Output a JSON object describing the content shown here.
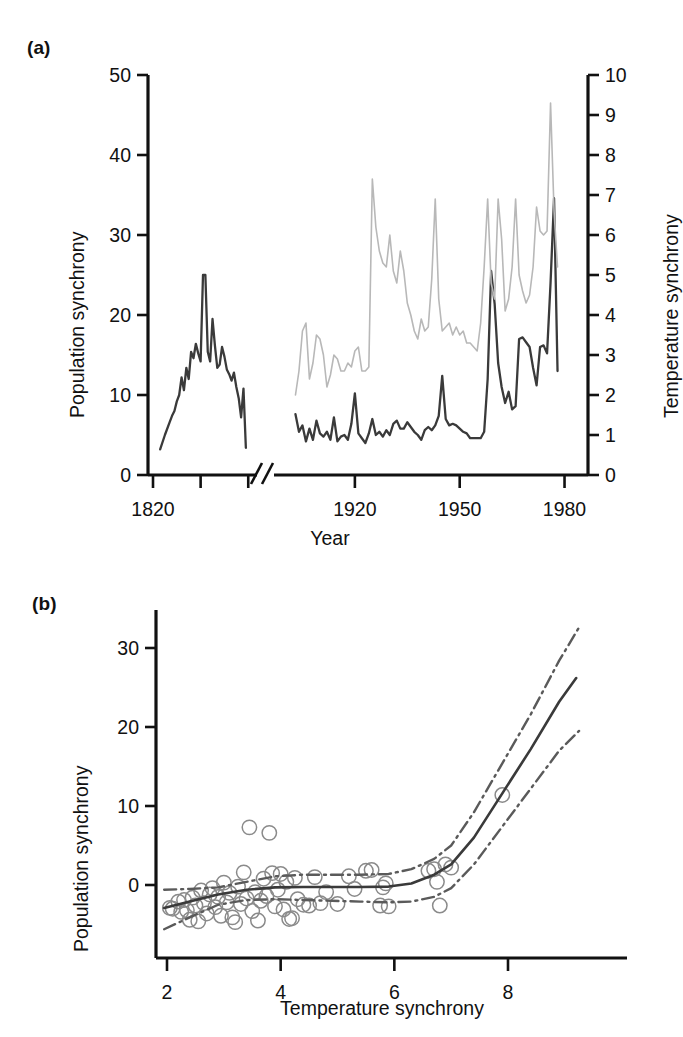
{
  "figure": {
    "background": "#ffffff",
    "ink": "#1a1a1a"
  },
  "panel_a": {
    "label": "(a)",
    "left_axis_title": "Population synchrony",
    "right_axis_title": "Temperature synchrony",
    "x_axis_title": "Year",
    "axis_break_note": "broken x-axis between 1860 and 1900",
    "colors": {
      "population_line": "#3a3a3a",
      "temperature_line": "#b8b8b8",
      "axis": "#111111"
    }
  },
  "panel_b": {
    "label": "(b)",
    "y_axis_title": "Population synchrony",
    "x_axis_title": "Temperature synchrony",
    "colors": {
      "fit_line": "#3a3a3a",
      "confidence_line": "#5a5a5a",
      "point_stroke": "#8a8a8a",
      "axis": "#111111"
    }
  },
  "chart_data": [
    {
      "id": "panel-a",
      "type": "line",
      "title": "(a)",
      "xlabel": "Year",
      "ylabel": "Population synchrony",
      "y2label": "Temperature synchrony",
      "xlim": [
        1820,
        1985
      ],
      "ylim": [
        0,
        50
      ],
      "y2lim": [
        0,
        10
      ],
      "grid": false,
      "legend": "none",
      "x_break": {
        "from": 1862,
        "to": 1898,
        "label": "axis break"
      },
      "xticks": [
        1820,
        1840,
        1860,
        1920,
        1950,
        1980
      ],
      "xticklabels": [
        "1820",
        "",
        "",
        "1920",
        "1950",
        "1980"
      ],
      "yticks": [
        0,
        10,
        20,
        30,
        40,
        50
      ],
      "yticklabels": [
        "0",
        "10",
        "20",
        "30",
        "40",
        "50"
      ],
      "y2ticks": [
        0,
        1,
        2,
        3,
        4,
        5,
        6,
        7,
        8,
        9,
        10
      ],
      "y2ticklabels": [
        "0",
        "1",
        "2",
        "3",
        "4",
        "5",
        "6",
        "7",
        "8",
        "9",
        "10"
      ],
      "series": [
        {
          "name": "Population synchrony",
          "axis": "left",
          "color": "#3a3a3a",
          "segment": "early",
          "x": [
            1823,
            1825,
            1827,
            1828,
            1829,
            1830,
            1831,
            1832,
            1833,
            1834,
            1835,
            1836,
            1837,
            1838,
            1839,
            1840,
            1841,
            1842,
            1843,
            1844,
            1845,
            1846,
            1847,
            1848,
            1849,
            1850,
            1851,
            1852,
            1853,
            1854,
            1855,
            1856,
            1857,
            1858,
            1859
          ],
          "y": [
            3.2,
            5.0,
            6.6,
            7.4,
            8.0,
            9.2,
            10.0,
            12.2,
            10.6,
            13.4,
            12.0,
            15.4,
            14.6,
            16.4,
            15.2,
            14.2,
            25.0,
            25.0,
            15.4,
            14.2,
            19.5,
            16.2,
            13.4,
            13.8,
            16.0,
            14.8,
            13.2,
            12.6,
            11.8,
            12.8,
            11.0,
            9.6,
            7.2,
            10.8,
            3.4
          ]
        },
        {
          "name": "Population synchrony",
          "axis": "left",
          "color": "#3a3a3a",
          "segment": "late",
          "x": [
            1903,
            1904,
            1905,
            1906,
            1907,
            1908,
            1909,
            1910,
            1911,
            1912,
            1913,
            1914,
            1915,
            1916,
            1917,
            1918,
            1919,
            1920,
            1921,
            1922,
            1923,
            1924,
            1925,
            1926,
            1927,
            1928,
            1929,
            1930,
            1931,
            1932,
            1933,
            1934,
            1935,
            1936,
            1937,
            1938,
            1939,
            1940,
            1941,
            1942,
            1943,
            1944,
            1945,
            1946,
            1947,
            1948,
            1949,
            1950,
            1951,
            1952,
            1953,
            1954,
            1955,
            1956,
            1957,
            1958,
            1959,
            1960,
            1961,
            1962,
            1963,
            1964,
            1965,
            1966,
            1967,
            1968,
            1969,
            1970,
            1971,
            1972,
            1973,
            1974,
            1975,
            1976,
            1977,
            1978,
            1979,
            1980
          ],
          "y": [
            7.6,
            5.4,
            6.2,
            4.2,
            5.8,
            4.4,
            6.8,
            5.2,
            4.8,
            5.4,
            4.4,
            7.2,
            4.2,
            4.8,
            5.0,
            4.4,
            6.4,
            10.2,
            5.2,
            4.6,
            4.0,
            5.2,
            7.0,
            5.0,
            5.4,
            4.8,
            5.6,
            5.0,
            6.4,
            6.8,
            5.8,
            5.8,
            6.6,
            6.0,
            5.4,
            5.0,
            4.4,
            5.6,
            6.0,
            5.6,
            6.2,
            7.4,
            12.4,
            7.0,
            6.2,
            6.4,
            6.2,
            5.8,
            5.4,
            5.2,
            4.6,
            4.6,
            4.6,
            4.6,
            5.4,
            12.0,
            25.5,
            21.4,
            14.0,
            11.0,
            9.0,
            10.4,
            8.2,
            8.6,
            17.0,
            17.2,
            16.6,
            16.0,
            13.4,
            11.2,
            16.0,
            16.2,
            15.2,
            24.0,
            34.6,
            13.0
          ]
        },
        {
          "name": "Temperature synchrony",
          "axis": "right",
          "color": "#b8b8b8",
          "segment": "late",
          "x": [
            1903,
            1904,
            1905,
            1906,
            1907,
            1908,
            1909,
            1910,
            1911,
            1912,
            1913,
            1914,
            1915,
            1916,
            1917,
            1918,
            1919,
            1920,
            1921,
            1922,
            1923,
            1924,
            1925,
            1926,
            1927,
            1928,
            1929,
            1930,
            1931,
            1932,
            1933,
            1934,
            1935,
            1936,
            1937,
            1938,
            1939,
            1940,
            1941,
            1942,
            1943,
            1944,
            1945,
            1946,
            1947,
            1948,
            1949,
            1950,
            1951,
            1952,
            1953,
            1954,
            1955,
            1956,
            1957,
            1958,
            1959,
            1960,
            1961,
            1962,
            1963,
            1964,
            1965,
            1966,
            1967,
            1968,
            1969,
            1970,
            1971,
            1972,
            1973,
            1974,
            1975,
            1976,
            1977,
            1978,
            1979,
            1980
          ],
          "y": [
            2.0,
            2.6,
            3.6,
            3.8,
            2.4,
            2.8,
            3.5,
            3.4,
            3.0,
            2.2,
            2.5,
            3.0,
            2.9,
            2.6,
            2.6,
            2.8,
            2.7,
            3.1,
            3.2,
            2.6,
            2.6,
            2.7,
            7.4,
            6.2,
            5.6,
            5.3,
            5.2,
            6.0,
            5.1,
            4.8,
            5.6,
            5.1,
            4.3,
            4.0,
            3.6,
            3.4,
            3.9,
            3.6,
            3.7,
            4.9,
            6.9,
            4.4,
            3.6,
            3.7,
            3.8,
            3.5,
            3.7,
            3.5,
            3.6,
            3.3,
            3.3,
            3.2,
            3.1,
            3.8,
            5.2,
            6.9,
            4.8,
            4.4,
            6.9,
            5.9,
            4.1,
            4.4,
            5.2,
            6.9,
            5.0,
            4.6,
            4.3,
            4.5,
            5.2,
            6.7,
            6.1,
            6.0,
            6.1,
            9.3,
            6.6,
            5.2
          ]
        }
      ]
    },
    {
      "id": "panel-b",
      "type": "scatter",
      "title": "(b)",
      "xlabel": "Temperature synchrony",
      "ylabel": "Population synchrony",
      "xlim": [
        1.8,
        9.4
      ],
      "ylim": [
        -6,
        33
      ],
      "grid": false,
      "legend": "none",
      "xticks": [
        2,
        4,
        6,
        8
      ],
      "xticklabels": [
        "2",
        "4",
        "6",
        "8"
      ],
      "yticks": [
        0,
        10,
        20,
        30
      ],
      "yticklabels": [
        "0",
        "10",
        "20",
        "30"
      ],
      "points": [
        [
          2.05,
          -2.9
        ],
        [
          2.1,
          -3.0
        ],
        [
          2.2,
          -2.1
        ],
        [
          2.25,
          -3.4
        ],
        [
          2.3,
          -1.9
        ],
        [
          2.35,
          -3.2
        ],
        [
          2.4,
          -4.4
        ],
        [
          2.45,
          -1.6
        ],
        [
          2.5,
          -2.6
        ],
        [
          2.55,
          -4.6
        ],
        [
          2.6,
          -0.7
        ],
        [
          2.65,
          -2.3
        ],
        [
          2.7,
          -3.6
        ],
        [
          2.75,
          -1.2
        ],
        [
          2.8,
          -0.4
        ],
        [
          2.85,
          -2.8
        ],
        [
          2.9,
          -1.5
        ],
        [
          2.95,
          -3.9
        ],
        [
          3.0,
          0.3
        ],
        [
          3.05,
          -2.2
        ],
        [
          3.1,
          -1.0
        ],
        [
          3.15,
          -4.1
        ],
        [
          3.2,
          -4.7
        ],
        [
          3.25,
          -0.2
        ],
        [
          3.3,
          -2.4
        ],
        [
          3.35,
          1.6
        ],
        [
          3.4,
          -1.7
        ],
        [
          3.45,
          7.3
        ],
        [
          3.5,
          -3.3
        ],
        [
          3.55,
          -0.9
        ],
        [
          3.6,
          -4.5
        ],
        [
          3.65,
          -2.0
        ],
        [
          3.7,
          0.8
        ],
        [
          3.75,
          -1.4
        ],
        [
          3.8,
          6.6
        ],
        [
          3.85,
          1.5
        ],
        [
          3.9,
          -2.7
        ],
        [
          3.95,
          -0.6
        ],
        [
          4.0,
          1.4
        ],
        [
          4.05,
          -3.1
        ],
        [
          4.1,
          0.4
        ],
        [
          4.15,
          -4.3
        ],
        [
          4.2,
          -4.2
        ],
        [
          4.25,
          0.9
        ],
        [
          4.3,
          -1.8
        ],
        [
          4.4,
          -2.5
        ],
        [
          4.5,
          -2.6
        ],
        [
          4.6,
          1.0
        ],
        [
          4.7,
          -2.3
        ],
        [
          4.8,
          -0.9
        ],
        [
          5.0,
          -2.4
        ],
        [
          5.2,
          1.1
        ],
        [
          5.3,
          -0.5
        ],
        [
          5.5,
          1.8
        ],
        [
          5.6,
          1.9
        ],
        [
          5.75,
          -2.6
        ],
        [
          5.8,
          -0.3
        ],
        [
          5.85,
          0.2
        ],
        [
          5.9,
          -2.7
        ],
        [
          6.6,
          1.8
        ],
        [
          6.7,
          2.0
        ],
        [
          6.75,
          0.4
        ],
        [
          6.8,
          -2.6
        ],
        [
          6.9,
          2.6
        ],
        [
          7.0,
          2.2
        ],
        [
          7.9,
          11.4
        ]
      ],
      "fit_line": {
        "name": "Fitted GAM smooth",
        "x": [
          1.95,
          2.4,
          2.9,
          3.4,
          3.9,
          4.4,
          4.9,
          5.4,
          5.9,
          6.3,
          6.7,
          7.0,
          7.4,
          7.9,
          8.4,
          8.9,
          9.2
        ],
        "y": [
          -2.9,
          -2.1,
          -1.2,
          -0.6,
          -0.3,
          -0.25,
          -0.25,
          -0.25,
          -0.2,
          0.2,
          1.3,
          2.6,
          6.0,
          11.6,
          17.2,
          23.2,
          26.2
        ]
      },
      "confidence_upper": {
        "name": "Upper 95% confidence band",
        "x": [
          1.95,
          2.4,
          2.9,
          3.4,
          3.9,
          4.4,
          4.9,
          5.4,
          5.9,
          6.3,
          6.7,
          7.0,
          7.4,
          7.9,
          8.4,
          8.9,
          9.25
        ],
        "y": [
          -0.6,
          -0.5,
          -0.3,
          0.4,
          1.1,
          1.3,
          1.3,
          1.3,
          1.4,
          2.0,
          3.3,
          5.0,
          9.2,
          15.4,
          21.6,
          28.4,
          32.6
        ]
      },
      "confidence_lower": {
        "name": "Lower 95% confidence band",
        "x": [
          1.95,
          2.4,
          2.9,
          3.4,
          3.9,
          4.4,
          4.9,
          5.4,
          5.9,
          6.3,
          6.7,
          7.0,
          7.4,
          7.9,
          8.4,
          8.9,
          9.25
        ],
        "y": [
          -5.6,
          -4.1,
          -2.5,
          -1.9,
          -1.8,
          -1.9,
          -2.0,
          -2.1,
          -2.2,
          -2.1,
          -1.5,
          -0.4,
          2.6,
          7.4,
          12.2,
          17.0,
          19.5
        ]
      }
    }
  ]
}
